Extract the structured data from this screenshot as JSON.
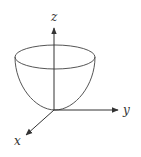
{
  "diagram": {
    "type": "3d-paraboloid",
    "axes": {
      "z_label": "z",
      "y_label": "y",
      "x_label": "x"
    },
    "colors": {
      "stroke": "#555555",
      "background": "#ffffff"
    }
  }
}
